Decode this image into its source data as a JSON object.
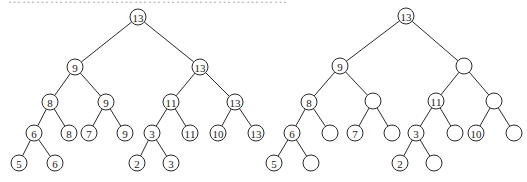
{
  "caption_fragment": "……………………………………………………",
  "trees": [
    {
      "name": "segment-tree-full",
      "nodes": [
        {
          "id": "a0",
          "label": "13",
          "x": 138,
          "y": 17
        },
        {
          "id": "a1",
          "label": "9",
          "x": 75,
          "y": 67
        },
        {
          "id": "a2",
          "label": "13",
          "x": 200,
          "y": 67
        },
        {
          "id": "a3",
          "label": "8",
          "x": 50,
          "y": 102
        },
        {
          "id": "a4",
          "label": "9",
          "x": 106,
          "y": 102
        },
        {
          "id": "a5",
          "label": "11",
          "x": 171,
          "y": 102
        },
        {
          "id": "a6",
          "label": "13",
          "x": 235,
          "y": 102
        },
        {
          "id": "a7",
          "label": "6",
          "x": 34,
          "y": 133
        },
        {
          "id": "a8",
          "label": "8",
          "x": 69,
          "y": 133
        },
        {
          "id": "a9",
          "label": "7",
          "x": 89,
          "y": 133
        },
        {
          "id": "a10",
          "label": "9",
          "x": 125,
          "y": 133
        },
        {
          "id": "a11",
          "label": "3",
          "x": 152,
          "y": 133
        },
        {
          "id": "a12",
          "label": "11",
          "x": 190,
          "y": 133
        },
        {
          "id": "a13",
          "label": "10",
          "x": 218,
          "y": 133
        },
        {
          "id": "a14",
          "label": "13",
          "x": 256,
          "y": 133
        },
        {
          "id": "a15",
          "label": "5",
          "x": 19,
          "y": 163
        },
        {
          "id": "a16",
          "label": "6",
          "x": 55,
          "y": 163
        },
        {
          "id": "a17",
          "label": "2",
          "x": 137,
          "y": 163
        },
        {
          "id": "a18",
          "label": "3",
          "x": 171,
          "y": 163
        }
      ],
      "edges": [
        [
          "a0",
          "a1"
        ],
        [
          "a0",
          "a2"
        ],
        [
          "a1",
          "a3"
        ],
        [
          "a1",
          "a4"
        ],
        [
          "a2",
          "a5"
        ],
        [
          "a2",
          "a6"
        ],
        [
          "a3",
          "a7"
        ],
        [
          "a3",
          "a8"
        ],
        [
          "a4",
          "a9"
        ],
        [
          "a4",
          "a10"
        ],
        [
          "a5",
          "a11"
        ],
        [
          "a5",
          "a12"
        ],
        [
          "a6",
          "a13"
        ],
        [
          "a6",
          "a14"
        ],
        [
          "a7",
          "a15"
        ],
        [
          "a7",
          "a16"
        ],
        [
          "a11",
          "a17"
        ],
        [
          "a11",
          "a18"
        ]
      ]
    },
    {
      "name": "segment-tree-partial",
      "nodes": [
        {
          "id": "b0",
          "label": "13",
          "x": 406,
          "y": 16
        },
        {
          "id": "b1",
          "label": "9",
          "x": 340,
          "y": 66
        },
        {
          "id": "b2",
          "label": "",
          "x": 464,
          "y": 66
        },
        {
          "id": "b3",
          "label": "8",
          "x": 309,
          "y": 102
        },
        {
          "id": "b4",
          "label": "",
          "x": 373,
          "y": 101
        },
        {
          "id": "b5",
          "label": "11",
          "x": 436,
          "y": 101
        },
        {
          "id": "b6",
          "label": "",
          "x": 494,
          "y": 101
        },
        {
          "id": "b7",
          "label": "6",
          "x": 292,
          "y": 133
        },
        {
          "id": "b8",
          "label": "",
          "x": 330,
          "y": 133
        },
        {
          "id": "b9",
          "label": "7",
          "x": 355,
          "y": 133
        },
        {
          "id": "b10",
          "label": "",
          "x": 392,
          "y": 133
        },
        {
          "id": "b11",
          "label": "3",
          "x": 416,
          "y": 133
        },
        {
          "id": "b12",
          "label": "",
          "x": 455,
          "y": 133
        },
        {
          "id": "b13",
          "label": "10",
          "x": 476,
          "y": 133
        },
        {
          "id": "b14",
          "label": "",
          "x": 514,
          "y": 133
        },
        {
          "id": "b15",
          "label": "5",
          "x": 274,
          "y": 163
        },
        {
          "id": "b16",
          "label": "",
          "x": 311,
          "y": 163
        },
        {
          "id": "b17",
          "label": "2",
          "x": 400,
          "y": 163
        },
        {
          "id": "b18",
          "label": "",
          "x": 434,
          "y": 163
        }
      ],
      "edges": [
        [
          "b0",
          "b1"
        ],
        [
          "b0",
          "b2"
        ],
        [
          "b1",
          "b3"
        ],
        [
          "b1",
          "b4"
        ],
        [
          "b2",
          "b5"
        ],
        [
          "b2",
          "b6"
        ],
        [
          "b3",
          "b7"
        ],
        [
          "b3",
          "b8"
        ],
        [
          "b4",
          "b9"
        ],
        [
          "b4",
          "b10"
        ],
        [
          "b5",
          "b11"
        ],
        [
          "b5",
          "b12"
        ],
        [
          "b6",
          "b13"
        ],
        [
          "b6",
          "b14"
        ],
        [
          "b7",
          "b15"
        ],
        [
          "b7",
          "b16"
        ],
        [
          "b11",
          "b17"
        ],
        [
          "b11",
          "b18"
        ]
      ]
    }
  ],
  "style": {
    "stroke": "#2a2a2a",
    "node_radius": 8
  }
}
